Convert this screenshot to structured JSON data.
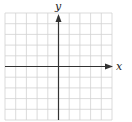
{
  "diagram": {
    "type": "coordinate-grid",
    "x_axis_label": "x",
    "y_axis_label": "y",
    "grid": {
      "columns": 10,
      "rows": 10,
      "line_color": "#cfcfcf",
      "axis_color": "#333333"
    }
  }
}
